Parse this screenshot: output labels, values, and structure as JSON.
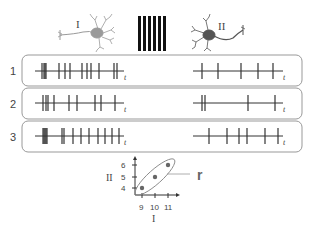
{
  "figure": {
    "neuron_left": {
      "label": "I",
      "color": "#9a9a9a"
    },
    "neuron_right": {
      "label": "II",
      "color": "#555555"
    },
    "stimulus": {
      "bar_count": 6,
      "color": "#111111"
    },
    "time_label": "t",
    "trials": [
      {
        "label": "1",
        "neuron_I_spikes": [
          42,
          44,
          45,
          46,
          59,
          65,
          70,
          82,
          87,
          91,
          99,
          114,
          117
        ],
        "neuron_II_spikes": [
          202,
          218,
          241,
          258,
          273
        ]
      },
      {
        "label": "2",
        "neuron_I_spikes": [
          43,
          46,
          48,
          54,
          69,
          77,
          95,
          101,
          115
        ],
        "neuron_II_spikes": [
          202,
          205,
          248,
          275
        ]
      },
      {
        "label": "3",
        "neuron_I_spikes": [
          43,
          44,
          45,
          46,
          47,
          62,
          64,
          73,
          81,
          89,
          98,
          105,
          112,
          119
        ],
        "neuron_II_spikes": [
          209,
          227,
          239,
          247,
          265,
          278
        ]
      }
    ],
    "correlation_label": "r"
  },
  "chart_data": {
    "type": "scatter",
    "title": "",
    "xlabel": "I",
    "ylabel": "II",
    "x_ticks": [
      9,
      10,
      11
    ],
    "y_ticks": [
      4,
      5,
      6
    ],
    "points": [
      {
        "x": 9,
        "y": 4
      },
      {
        "x": 10,
        "y": 5
      },
      {
        "x": 11,
        "y": 6
      }
    ],
    "annotation": "r",
    "grid": false
  }
}
